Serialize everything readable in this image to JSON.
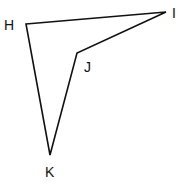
{
  "figure": {
    "type": "quadrilateral",
    "stroke_color": "#111111",
    "vertices": [
      {
        "label": "H",
        "x": 26,
        "y": 24,
        "label_x": 4,
        "label_y": 30
      },
      {
        "label": "I",
        "x": 166,
        "y": 12,
        "label_x": 172,
        "label_y": 18
      },
      {
        "label": "J",
        "x": 77,
        "y": 53,
        "label_x": 84,
        "label_y": 72
      },
      {
        "label": "K",
        "x": 50,
        "y": 155,
        "label_x": 45,
        "label_y": 177
      }
    ]
  }
}
